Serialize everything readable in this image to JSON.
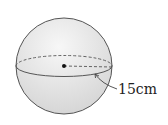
{
  "figure": {
    "type": "sphere",
    "radius_label": "15cm",
    "colors": {
      "sphere_fill": "#e6e6e6",
      "outline": "#555555",
      "background": "#ffffff"
    }
  }
}
